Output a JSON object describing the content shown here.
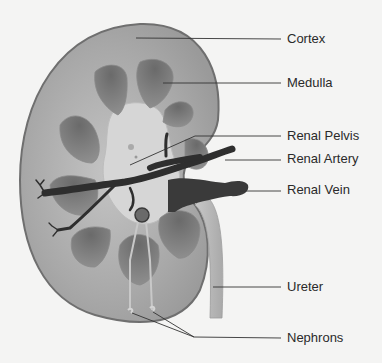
{
  "diagram": {
    "labels": [
      {
        "id": "cortex",
        "text": "Cortex",
        "y": 31
      },
      {
        "id": "medulla",
        "text": "Medulla",
        "y": 75
      },
      {
        "id": "renal-pelvis",
        "text": "Renal Pelvis",
        "y": 128
      },
      {
        "id": "renal-artery",
        "text": "Renal Artery",
        "y": 151
      },
      {
        "id": "renal-vein",
        "text": "Renal Vein",
        "y": 182
      },
      {
        "id": "ureter",
        "text": "Ureter",
        "y": 279
      },
      {
        "id": "nephrons",
        "text": "Nephrons",
        "y": 330
      }
    ],
    "colors": {
      "background": "#f4f4f3",
      "cortex": "#a9a9a9",
      "outline": "#6f6f6f",
      "medulla_pyramid": "#7c7c7c",
      "pelvis": "#d4d4d4",
      "vessels": "#2e2e2e",
      "ureter": "#bdbdbd",
      "leader_line": "#333333",
      "text": "#2a2a2a"
    }
  }
}
